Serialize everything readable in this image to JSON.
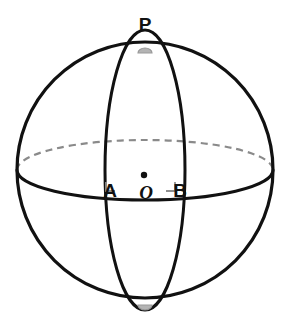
{
  "figure": {
    "type": "geometry-diagram",
    "background_color": "#ffffff",
    "width": 290,
    "height": 336
  },
  "colors": {
    "stroke_primary": "#111111",
    "stroke_hidden": "#8a8a8a",
    "right_angle_marker": "#8f8f8f",
    "pole_marker": "#9a9a9a",
    "point_dot": "#111111",
    "background": "#ffffff"
  },
  "sphere": {
    "name": "sphere-outline",
    "center_x": 145,
    "center_y": 170,
    "radius": 128,
    "stroke_width": 3.2
  },
  "equator": {
    "name": "equator-ellipse",
    "center_x": 145,
    "center_y": 170,
    "rx": 128,
    "ry": 30,
    "front_solid": true,
    "back_dashed": true,
    "dash_pattern": "7 5",
    "stroke_width_front": 3.0,
    "stroke_width_back": 2.2
  },
  "meridian": {
    "name": "meridian-ellipse",
    "center_x": 145,
    "center_y": 170,
    "rx": 40,
    "ry": 140,
    "stroke_width": 3.0
  },
  "points": [
    {
      "id": "P",
      "label": "P",
      "role": "north-pole",
      "label_x": 145,
      "label_y": 30,
      "dot_visible": false,
      "marker": "pole-cap"
    },
    {
      "id": "A",
      "label": "A",
      "role": "equator-left-intersection",
      "label_x": 110,
      "label_y": 196,
      "dot_visible": false
    },
    {
      "id": "O",
      "label": "O",
      "role": "sphere-center",
      "label_x": 146,
      "label_y": 198,
      "dot_visible": true,
      "dot_x": 144,
      "dot_y": 175,
      "dot_r": 3.2
    },
    {
      "id": "B",
      "label": "B",
      "role": "equator-right-intersection",
      "label_x": 180,
      "label_y": 196,
      "dot_visible": false
    }
  ],
  "right_angle_markers": [
    {
      "name": "right-angle-at-A",
      "x": 106,
      "y": 191,
      "size": 9
    },
    {
      "name": "right-angle-at-B",
      "x": 161,
      "y": 191,
      "size": 9
    }
  ],
  "pole_markers": [
    {
      "name": "pole-marker-top",
      "cx": 145,
      "cy": 52,
      "rx": 7,
      "ry": 5
    },
    {
      "name": "pole-marker-bottom",
      "cx": 145,
      "cy": 305,
      "rx": 7,
      "ry": 5
    }
  ],
  "caption": ""
}
